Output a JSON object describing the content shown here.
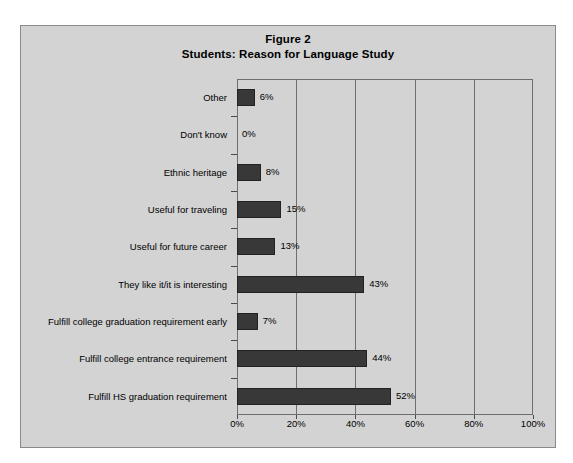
{
  "figure": {
    "title_line1": "Figure 2",
    "title_line2": "Students: Reason for Language Study",
    "frame_color": "#8a8a8a",
    "background_color": "#d3d3d3",
    "bar_color": "#383838",
    "axis_color": "#6e6e6e"
  },
  "chart_data": {
    "type": "bar",
    "orientation": "horizontal",
    "subtitle": "Students: Reason for Language Study",
    "xlabel": "",
    "ylabel": "",
    "xlim": [
      0,
      100
    ],
    "xticks": [
      0,
      20,
      40,
      60,
      80,
      100
    ],
    "xtick_labels": [
      "0%",
      "20%",
      "40%",
      "60%",
      "80%",
      "100%"
    ],
    "grid": true,
    "grid_axis": "x",
    "legend": false,
    "value_label_suffix": "%",
    "categories": [
      "Fulfill HS graduation requirement",
      "Fulfill college entrance requirement",
      "Fulfill college graduation requirement early",
      "They like it/it is interesting",
      "Useful for future career",
      "Useful for traveling",
      "Ethnic heritage",
      "Don't know",
      "Other"
    ],
    "values": [
      52,
      44,
      7,
      43,
      13,
      15,
      8,
      0,
      6
    ],
    "value_labels": [
      "52%",
      "44%",
      "7%",
      "43%",
      "13%",
      "15%",
      "8%",
      "0%",
      "6%"
    ],
    "rows_top_to_bottom": [
      {
        "category": "Other",
        "value": 6,
        "label": "6%"
      },
      {
        "category": "Don't know",
        "value": 0,
        "label": "0%"
      },
      {
        "category": "Ethnic heritage",
        "value": 8,
        "label": "8%"
      },
      {
        "category": "Useful for traveling",
        "value": 15,
        "label": "15%"
      },
      {
        "category": "Useful for future career",
        "value": 13,
        "label": "13%"
      },
      {
        "category": "They like it/it is interesting",
        "value": 43,
        "label": "43%"
      },
      {
        "category": "Fulfill college graduation requirement early",
        "value": 7,
        "label": "7%"
      },
      {
        "category": "Fulfill college entrance requirement",
        "value": 44,
        "label": "44%"
      },
      {
        "category": "Fulfill HS graduation requirement",
        "value": 52,
        "label": "52%"
      }
    ]
  }
}
